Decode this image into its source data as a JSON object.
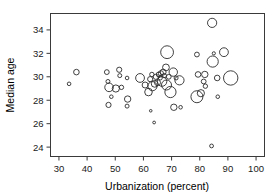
{
  "chart_data": {
    "type": "scatter",
    "title": "",
    "subtitle": "",
    "xlabel": "Urbanization (percent)",
    "ylabel": "Median age",
    "xlim": [
      27,
      103
    ],
    "ylim": [
      23.2,
      35.4
    ],
    "xticks": [
      30,
      40,
      50,
      60,
      70,
      80,
      90,
      100
    ],
    "yticks": [
      24,
      26,
      28,
      30,
      32,
      34
    ],
    "xtick_labels": [
      "30",
      "40",
      "50",
      "60",
      "70",
      "80",
      "90",
      "100"
    ],
    "ytick_labels": [
      "24",
      "26",
      "28",
      "30",
      "32",
      "34"
    ],
    "grid": false,
    "legend": null,
    "marker": "open-circle",
    "size_encoding": "bubble area proportional to a third variable (population)",
    "series": [
      {
        "name": "countries",
        "points": [
          {
            "x": 33.6,
            "y": 29.4,
            "r": 1.8
          },
          {
            "x": 36.2,
            "y": 30.4,
            "r": 2.8
          },
          {
            "x": 47.0,
            "y": 30.4,
            "r": 2.4
          },
          {
            "x": 47.4,
            "y": 29.6,
            "r": 2.0
          },
          {
            "x": 47.8,
            "y": 29.1,
            "r": 4.3
          },
          {
            "x": 47.6,
            "y": 27.6,
            "r": 2.6
          },
          {
            "x": 48.6,
            "y": 28.3,
            "r": 1.8
          },
          {
            "x": 50.2,
            "y": 29.0,
            "r": 3.6
          },
          {
            "x": 51.4,
            "y": 30.6,
            "r": 2.6
          },
          {
            "x": 51.6,
            "y": 30.1,
            "r": 2.0
          },
          {
            "x": 52.2,
            "y": 29.1,
            "r": 2.2
          },
          {
            "x": 54.2,
            "y": 29.9,
            "r": 1.8
          },
          {
            "x": 54.4,
            "y": 28.1,
            "r": 3.2
          },
          {
            "x": 54.2,
            "y": 27.5,
            "r": 2.0
          },
          {
            "x": 58.8,
            "y": 29.9,
            "r": 4.4
          },
          {
            "x": 60.6,
            "y": 29.3,
            "r": 3.0
          },
          {
            "x": 61.8,
            "y": 28.7,
            "r": 3.8
          },
          {
            "x": 62.4,
            "y": 29.8,
            "r": 2.6
          },
          {
            "x": 63.2,
            "y": 29.2,
            "r": 4.6
          },
          {
            "x": 63.0,
            "y": 30.2,
            "r": 2.2
          },
          {
            "x": 64.0,
            "y": 29.4,
            "r": 3.4
          },
          {
            "x": 64.4,
            "y": 30.0,
            "r": 2.6
          },
          {
            "x": 65.0,
            "y": 29.5,
            "r": 3.0
          },
          {
            "x": 65.4,
            "y": 30.2,
            "r": 2.4
          },
          {
            "x": 66.0,
            "y": 29.9,
            "r": 2.0
          },
          {
            "x": 66.2,
            "y": 30.3,
            "r": 2.6
          },
          {
            "x": 66.6,
            "y": 29.6,
            "r": 4.8
          },
          {
            "x": 67.0,
            "y": 30.4,
            "r": 3.0
          },
          {
            "x": 67.4,
            "y": 30.1,
            "r": 2.2
          },
          {
            "x": 68.0,
            "y": 30.8,
            "r": 3.4
          },
          {
            "x": 68.4,
            "y": 32.1,
            "r": 6.4
          },
          {
            "x": 68.2,
            "y": 29.3,
            "r": 5.0
          },
          {
            "x": 69.0,
            "y": 30.0,
            "r": 2.4
          },
          {
            "x": 69.6,
            "y": 28.7,
            "r": 5.6
          },
          {
            "x": 70.6,
            "y": 30.4,
            "r": 4.2
          },
          {
            "x": 70.8,
            "y": 27.4,
            "r": 3.2
          },
          {
            "x": 71.6,
            "y": 29.9,
            "r": 2.0
          },
          {
            "x": 72.8,
            "y": 29.7,
            "r": 4.6
          },
          {
            "x": 73.2,
            "y": 27.4,
            "r": 1.8
          },
          {
            "x": 62.6,
            "y": 27.1,
            "r": 1.3
          },
          {
            "x": 63.8,
            "y": 26.1,
            "r": 1.4
          },
          {
            "x": 79.0,
            "y": 31.9,
            "r": 2.4
          },
          {
            "x": 79.4,
            "y": 30.2,
            "r": 2.8
          },
          {
            "x": 79.0,
            "y": 28.3,
            "r": 6.0
          },
          {
            "x": 80.4,
            "y": 28.6,
            "r": 3.6
          },
          {
            "x": 81.4,
            "y": 29.6,
            "r": 2.4
          },
          {
            "x": 81.8,
            "y": 30.2,
            "r": 3.2
          },
          {
            "x": 82.0,
            "y": 29.2,
            "r": 2.2
          },
          {
            "x": 84.4,
            "y": 34.6,
            "r": 4.6
          },
          {
            "x": 84.6,
            "y": 31.3,
            "r": 5.6
          },
          {
            "x": 85.0,
            "y": 32.0,
            "r": 1.6
          },
          {
            "x": 86.2,
            "y": 29.9,
            "r": 2.8
          },
          {
            "x": 86.4,
            "y": 28.3,
            "r": 1.8
          },
          {
            "x": 88.6,
            "y": 32.1,
            "r": 4.4
          },
          {
            "x": 84.2,
            "y": 24.1,
            "r": 1.9
          },
          {
            "x": 91.0,
            "y": 29.9,
            "r": 7.2
          }
        ]
      }
    ]
  },
  "axes": {
    "x_title": "Urbanization (percent)",
    "y_title": "Median age"
  }
}
